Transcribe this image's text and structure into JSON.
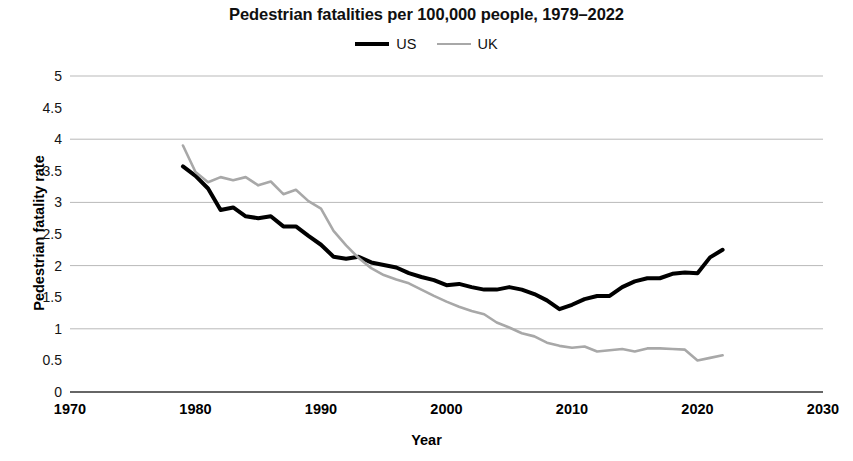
{
  "chart_data": {
    "type": "line",
    "title": "Pedestrian fatalities per 100,000 people, 1979–2022",
    "xlabel": "Year",
    "ylabel": "Pedestrian fatality rate",
    "xlim": [
      1970,
      2030
    ],
    "ylim": [
      0,
      5
    ],
    "xticks": [
      1970,
      1980,
      1990,
      2000,
      2010,
      2020,
      2030
    ],
    "yticks": [
      0,
      0.5,
      1,
      1.5,
      2,
      2.5,
      3,
      3.5,
      4,
      4.5,
      5
    ],
    "ytick_labels": [
      "0",
      "0.5",
      "1",
      "1.5",
      "2",
      "2.5",
      "3",
      "3.5",
      "4",
      "4.5",
      "5"
    ],
    "xtick_labels": [
      "1970",
      "1980",
      "1990",
      "2000",
      "2010",
      "2020",
      "2030"
    ],
    "grid": "horizontal-at-integers",
    "legend_position": "top-center",
    "x": [
      1979,
      1980,
      1981,
      1982,
      1983,
      1984,
      1985,
      1986,
      1987,
      1988,
      1989,
      1990,
      1991,
      1992,
      1993,
      1994,
      1995,
      1996,
      1997,
      1998,
      1999,
      2000,
      2001,
      2002,
      2003,
      2004,
      2005,
      2006,
      2007,
      2008,
      2009,
      2010,
      2011,
      2012,
      2013,
      2014,
      2015,
      2016,
      2017,
      2018,
      2019,
      2020,
      2021,
      2022
    ],
    "series": [
      {
        "name": "US",
        "color": "#000000",
        "width": 4,
        "values": [
          3.57,
          3.42,
          3.22,
          2.88,
          2.92,
          2.78,
          2.75,
          2.78,
          2.62,
          2.62,
          2.47,
          2.33,
          2.14,
          2.11,
          2.14,
          2.05,
          2.01,
          1.97,
          1.88,
          1.82,
          1.77,
          1.69,
          1.71,
          1.66,
          1.62,
          1.62,
          1.66,
          1.62,
          1.55,
          1.45,
          1.31,
          1.38,
          1.47,
          1.52,
          1.52,
          1.66,
          1.75,
          1.8,
          1.8,
          1.87,
          1.89,
          1.88,
          2.13,
          2.25
        ]
      },
      {
        "name": "UK",
        "color": "#a8a8a8",
        "width": 2.6,
        "values": [
          3.9,
          3.48,
          3.32,
          3.4,
          3.35,
          3.4,
          3.27,
          3.33,
          3.13,
          3.2,
          3.02,
          2.9,
          2.55,
          2.32,
          2.12,
          1.96,
          1.85,
          1.78,
          1.72,
          1.62,
          1.52,
          1.43,
          1.35,
          1.28,
          1.23,
          1.1,
          1.02,
          0.93,
          0.88,
          0.78,
          0.73,
          0.7,
          0.72,
          0.64,
          0.66,
          0.68,
          0.64,
          0.69,
          0.69,
          0.68,
          0.67,
          0.5,
          0.54,
          0.58
        ]
      }
    ]
  }
}
